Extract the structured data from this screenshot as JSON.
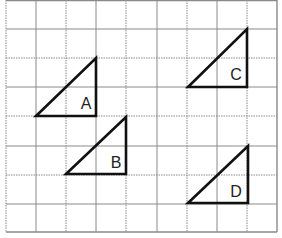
{
  "diagram": {
    "type": "grid-with-triangles",
    "grid": {
      "x_lines": [
        6,
        36,
        66,
        96,
        126,
        157,
        187,
        217,
        247,
        277
      ],
      "y_lines": [
        0,
        29,
        58,
        87,
        116,
        146,
        175,
        204,
        232
      ],
      "color": "#8a8a8a",
      "columns": 9,
      "rows": 8
    },
    "triangles": [
      {
        "label": "A",
        "points": [
          [
            36,
            116
          ],
          [
            96,
            116
          ],
          [
            96,
            58
          ]
        ],
        "label_pos": [
          86,
          109
        ]
      },
      {
        "label": "B",
        "points": [
          [
            66,
            174
          ],
          [
            126,
            174
          ],
          [
            126,
            117
          ]
        ],
        "label_pos": [
          116,
          168
        ]
      },
      {
        "label": "C",
        "points": [
          [
            188,
            87
          ],
          [
            247,
            87
          ],
          [
            247,
            29
          ]
        ],
        "label_pos": [
          236,
          80
        ]
      },
      {
        "label": "D",
        "points": [
          [
            188,
            203
          ],
          [
            248,
            203
          ],
          [
            248,
            146
          ]
        ],
        "label_pos": [
          236,
          197
        ]
      }
    ],
    "stroke_color": "#111111",
    "label_color": "#222222"
  }
}
